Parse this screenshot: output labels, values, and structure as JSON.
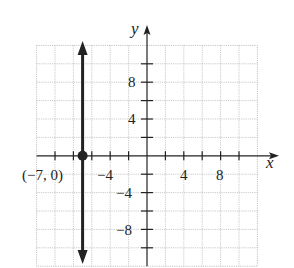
{
  "chart_data": {
    "type": "line",
    "title": "",
    "xlabel": "x",
    "ylabel": "y",
    "xlim": [
      -12,
      12
    ],
    "ylim": [
      -12,
      12
    ],
    "grid": true,
    "grid_step": 2,
    "tick_step": 2,
    "x_tick_labels": [
      {
        "value": -4,
        "text": "−4"
      },
      {
        "value": 4,
        "text": "4"
      },
      {
        "value": 8,
        "text": "8"
      }
    ],
    "y_tick_labels": [
      {
        "value": 8,
        "text": "8"
      },
      {
        "value": 4,
        "text": "4"
      },
      {
        "value": -4,
        "text": "−4"
      },
      {
        "value": -8,
        "text": "−8"
      }
    ],
    "series": [
      {
        "name": "vertical line x = -7",
        "kind": "vertical_line",
        "x": -7,
        "y_range": [
          -12,
          12
        ],
        "arrows": "both"
      }
    ],
    "points": [
      {
        "x": -7,
        "y": 0,
        "label": "(−7, 0)"
      }
    ]
  },
  "labels": {
    "x_axis": "x",
    "y_axis": "y",
    "point": "(−7, 0)",
    "xt_m4": "−4",
    "xt_4": "4",
    "xt_8": "8",
    "yt_8": "8",
    "yt_4": "4",
    "yt_m4": "−4",
    "yt_m8": "−8"
  }
}
